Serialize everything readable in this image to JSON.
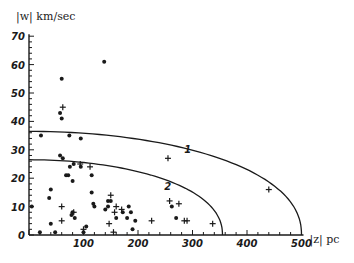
{
  "chart_data": {
    "type": "scatter",
    "title": "",
    "xlabel": "|z| pc",
    "ylabel": "|w| km/sec",
    "xlim": [
      0,
      500
    ],
    "ylim": [
      0,
      70
    ],
    "grid": false,
    "x_ticks": [
      100,
      200,
      300,
      400,
      500
    ],
    "x_tick_labels": [
      "100",
      "200",
      "300",
      "400",
      "500"
    ],
    "y_ticks": [
      0,
      10,
      20,
      30,
      40,
      50,
      60,
      70
    ],
    "y_tick_labels": [
      "0",
      "10",
      "20",
      "30",
      "40",
      "50",
      "60",
      "70"
    ],
    "series": [
      {
        "name": "dots",
        "marker": "dot",
        "points": [
          [
            60,
            55
          ],
          [
            138,
            61
          ],
          [
            60,
            41
          ],
          [
            57,
            43
          ],
          [
            22,
            35
          ],
          [
            74,
            35
          ],
          [
            95,
            34
          ],
          [
            57,
            28
          ],
          [
            62,
            27
          ],
          [
            82,
            25
          ],
          [
            95,
            24
          ],
          [
            75,
            24
          ],
          [
            68,
            21
          ],
          [
            72,
            21
          ],
          [
            80,
            19
          ],
          [
            115,
            21
          ],
          [
            115,
            15
          ],
          [
            40,
            16
          ],
          [
            37,
            13
          ],
          [
            5,
            10
          ],
          [
            118,
            11
          ],
          [
            120,
            10
          ],
          [
            145,
            12
          ],
          [
            150,
            12
          ],
          [
            145,
            10
          ],
          [
            183,
            10
          ],
          [
            172,
            8
          ],
          [
            187,
            8
          ],
          [
            80,
            8
          ],
          [
            78,
            7
          ],
          [
            84,
            6
          ],
          [
            195,
            5
          ],
          [
            180,
            6
          ],
          [
            40,
            4
          ],
          [
            100,
            1
          ],
          [
            105,
            3
          ],
          [
            20,
            1
          ],
          [
            48,
            1
          ],
          [
            190,
            2
          ],
          [
            262,
            10
          ],
          [
            270,
            6
          ],
          [
            140,
            9
          ],
          [
            160,
            6
          ]
        ]
      },
      {
        "name": "crosses",
        "marker": "cross",
        "points": [
          [
            62,
            45
          ],
          [
            94,
            25
          ],
          [
            112,
            24
          ],
          [
            255,
            27
          ],
          [
            440,
            16
          ],
          [
            60,
            10
          ],
          [
            60,
            5
          ],
          [
            82,
            8
          ],
          [
            150,
            14
          ],
          [
            170,
            9
          ],
          [
            157,
            8
          ],
          [
            147,
            4
          ],
          [
            155,
            1
          ],
          [
            225,
            5
          ],
          [
            258,
            12
          ],
          [
            275,
            11
          ],
          [
            285,
            5
          ],
          [
            290,
            5
          ],
          [
            337,
            4
          ],
          [
            100,
            2
          ],
          [
            160,
            10
          ]
        ]
      }
    ],
    "curves": [
      {
        "label": "1",
        "description": "outer boundary curve",
        "y_at_0": 36.5,
        "x_intercept": 500,
        "label_position": [
          285,
          29
        ]
      },
      {
        "label": "2",
        "description": "inner boundary curve",
        "y_at_0": 26.5,
        "x_intercept": 355,
        "label_position": [
          248,
          16
        ]
      }
    ],
    "legend": null
  },
  "axes": {
    "y_title": "|w| km/sec",
    "x_title": "|z| pc"
  },
  "colors": {
    "ink": "#1a1a1a",
    "background": "#ffffff"
  }
}
